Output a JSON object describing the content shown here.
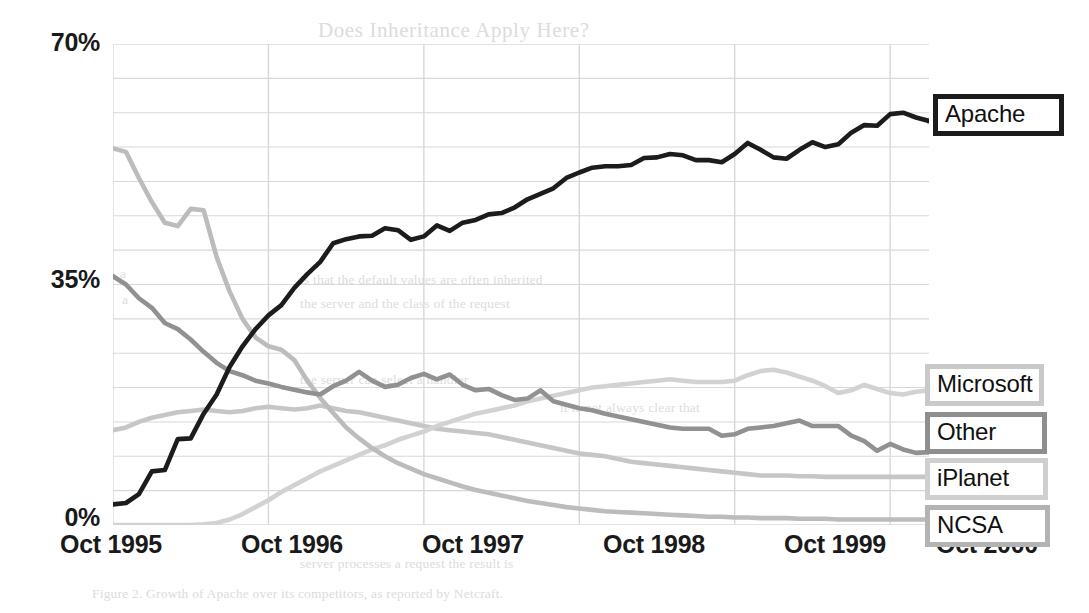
{
  "page": {
    "background_color": "#ffffff",
    "bleed_through_text": [
      {
        "text": "Does Inheritance Apply Here?",
        "x": 318,
        "y": 18,
        "kind": "title"
      },
      {
        "text": "a",
        "x": 120,
        "y": 266,
        "kind": "body"
      },
      {
        "text": "is that the default values are often inherited",
        "x": 300,
        "y": 272,
        "kind": "body"
      },
      {
        "text": "a",
        "x": 122,
        "y": 292,
        "kind": "body"
      },
      {
        "text": "the server and the class of the request",
        "x": 300,
        "y": 296,
        "kind": "body"
      },
      {
        "text": "the server can select a handler",
        "x": 300,
        "y": 372,
        "kind": "body"
      },
      {
        "text": "it is not always clear that",
        "x": 560,
        "y": 400,
        "kind": "body"
      },
      {
        "text": "server processes a request the result is",
        "x": 300,
        "y": 556,
        "kind": "body"
      },
      {
        "text": "Figure 2. Growth of Apache over its competitors, as reported by Netcraft.",
        "x": 92,
        "y": 586,
        "kind": "body"
      }
    ]
  },
  "chart_data": {
    "type": "line",
    "title": "",
    "xlabel": "",
    "ylabel": "",
    "xlim": [
      0,
      61
    ],
    "ylim": [
      0,
      70
    ],
    "ytick_values": [
      0,
      35,
      70
    ],
    "ytick_labels": [
      "0%",
      "35%",
      "70%"
    ],
    "gridline_step_y": 5,
    "xtick_labels": [
      "Oct 1995",
      "Oct 1996",
      "Oct 1997",
      "Oct 1998",
      "Oct 1999",
      "Oct 2000"
    ],
    "xtick_positions": [
      0,
      12,
      24,
      36,
      48,
      60
    ],
    "grid": true,
    "grid_color": "#d8d8d8",
    "legend": "inline-callouts-right",
    "series": [
      {
        "name": "Apache",
        "color": "#1c1c1c",
        "width": 4.6,
        "label_y_pct": 57.5,
        "values": [
          3.0,
          3.2,
          4.5,
          7.8,
          8.0,
          12.5,
          12.6,
          16.2,
          19.0,
          23.0,
          26.0,
          28.5,
          30.5,
          32.0,
          34.5,
          36.5,
          38.3,
          41.0,
          41.6,
          42.0,
          42.1,
          43.2,
          42.9,
          41.5,
          42.0,
          43.6,
          42.8,
          44.0,
          44.4,
          45.2,
          45.4,
          46.2,
          47.4,
          48.2,
          49.0,
          50.5,
          51.3,
          52.0,
          52.2,
          52.2,
          52.4,
          53.4,
          53.5,
          54.0,
          53.8,
          53.1,
          53.1,
          52.8,
          54.0,
          55.6,
          54.6,
          53.5,
          53.3,
          54.6,
          55.7,
          55.0,
          55.4,
          57.1,
          58.2,
          58.1,
          59.8,
          60.0,
          59.3,
          58.8
        ]
      },
      {
        "name": "NCSA",
        "color": "#bcbcbc",
        "width": 4.6,
        "label_y_pct": 1.2,
        "values": [
          54.8,
          54.3,
          50.5,
          47.0,
          44.0,
          43.5,
          46.0,
          45.8,
          39.0,
          34.0,
          30.0,
          27.3,
          26.0,
          25.5,
          24.0,
          21.0,
          18.5,
          16.3,
          14.2,
          12.6,
          11.2,
          10.0,
          9.0,
          8.2,
          7.4,
          6.8,
          6.2,
          5.6,
          5.1,
          4.7,
          4.3,
          3.9,
          3.5,
          3.2,
          2.9,
          2.6,
          2.4,
          2.2,
          2.0,
          1.9,
          1.8,
          1.7,
          1.6,
          1.5,
          1.4,
          1.3,
          1.2,
          1.2,
          1.1,
          1.1,
          1.0,
          1.0,
          1.0,
          0.9,
          0.9,
          0.9,
          0.8,
          0.8,
          0.8,
          0.8,
          0.8,
          0.8,
          0.8,
          0.8
        ]
      },
      {
        "name": "Other",
        "color": "#919191",
        "width": 4.6,
        "label_y_pct": 12.6,
        "values": [
          36.2,
          35.0,
          33.0,
          31.6,
          29.4,
          28.5,
          27.0,
          25.2,
          23.6,
          22.4,
          21.8,
          21.0,
          20.6,
          20.1,
          19.7,
          19.3,
          19.0,
          20.2,
          21.0,
          22.3,
          21.0,
          20.1,
          20.4,
          21.4,
          22.0,
          21.2,
          21.9,
          20.4,
          19.6,
          19.8,
          18.9,
          18.2,
          18.4,
          19.6,
          18.0,
          17.5,
          17.0,
          16.7,
          16.2,
          15.8,
          15.4,
          15.0,
          14.6,
          14.2,
          14.0,
          14.0,
          14.0,
          13.0,
          13.2,
          14.0,
          14.2,
          14.4,
          14.8,
          15.2,
          14.4,
          14.4,
          14.4,
          13.0,
          12.2,
          10.8,
          11.8,
          11.0,
          10.5,
          10.6
        ]
      },
      {
        "name": "Microsoft",
        "color": "#d2d2d2",
        "width": 4.6,
        "label_y_pct": 19.4,
        "values": [
          0.0,
          0.0,
          0.0,
          0.0,
          0.0,
          0.0,
          0.0,
          0.1,
          0.3,
          0.8,
          1.6,
          2.6,
          3.6,
          4.8,
          5.8,
          6.8,
          7.8,
          8.6,
          9.4,
          10.2,
          11.0,
          11.6,
          12.4,
          13.0,
          13.6,
          14.4,
          15.0,
          15.6,
          16.2,
          16.6,
          17.0,
          17.4,
          18.0,
          18.4,
          18.8,
          19.2,
          19.6,
          20.0,
          20.2,
          20.4,
          20.6,
          20.8,
          21.0,
          21.2,
          21.0,
          20.8,
          20.8,
          20.8,
          21.0,
          21.8,
          22.4,
          22.6,
          22.2,
          21.6,
          21.0,
          20.2,
          19.2,
          19.6,
          20.4,
          19.8,
          19.2,
          19.0,
          19.4,
          19.6
        ]
      },
      {
        "name": "iPlanet",
        "color": "#c6c6c6",
        "width": 4.6,
        "label_y_pct": 6.4,
        "values": [
          13.8,
          14.2,
          15.0,
          15.6,
          16.0,
          16.4,
          16.6,
          16.8,
          16.6,
          16.4,
          16.6,
          17.0,
          17.2,
          17.0,
          16.8,
          17.0,
          17.4,
          17.0,
          16.6,
          16.4,
          16.0,
          15.6,
          15.2,
          14.8,
          14.4,
          14.0,
          13.8,
          13.6,
          13.4,
          13.2,
          12.8,
          12.4,
          12.0,
          11.6,
          11.2,
          10.8,
          10.4,
          10.2,
          10.0,
          9.6,
          9.2,
          9.0,
          8.8,
          8.6,
          8.4,
          8.2,
          8.0,
          7.8,
          7.6,
          7.4,
          7.2,
          7.2,
          7.2,
          7.1,
          7.1,
          7.0,
          7.0,
          7.0,
          7.0,
          7.0,
          7.0,
          7.0,
          7.0,
          7.0
        ]
      }
    ]
  },
  "labels": {
    "apache": "Apache",
    "microsoft": "Microsoft",
    "other": "Other",
    "iplanet": "iPlanet",
    "ncsa": "NCSA"
  }
}
